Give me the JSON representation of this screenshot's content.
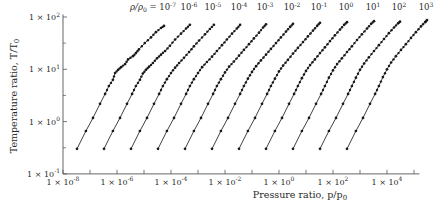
{
  "chart_data": {
    "type": "line",
    "title": "",
    "xlabel": "Pressure ratio, p/p0",
    "ylabel": "Temperature ratio, T/T0",
    "xscale": "log",
    "yscale": "log",
    "xlim": [
      1e-08,
      100000.0
    ],
    "ylim": [
      0.1,
      100
    ],
    "grid": false,
    "legend_position": "inline-top",
    "series_label_prefix": "ρ/ρ0 = ",
    "x_ticks": [
      "1 × 10^-8",
      "1 × 10^-6",
      "1 × 10^-4",
      "1 × 10^-2",
      "1 × 10^0",
      "1 × 10^2",
      "1 × 10^4"
    ],
    "y_ticks": [
      "1 × 10^-1",
      "1 × 10^0",
      "1 × 10^1",
      "1 × 10^2"
    ],
    "series": [
      {
        "name": "10^-7",
        "log_points": [
          [
            -7.48,
            -0.52
          ],
          [
            -7.15,
            -0.18
          ],
          [
            -6.89,
            0.07
          ],
          [
            -6.63,
            0.34
          ],
          [
            -6.44,
            0.53
          ],
          [
            -6.3,
            0.68
          ],
          [
            -6.15,
            0.8
          ],
          [
            -6.07,
            0.93
          ],
          [
            -5.96,
            0.99
          ],
          [
            -5.85,
            1.04
          ],
          [
            -5.7,
            1.1
          ],
          [
            -5.59,
            1.19
          ],
          [
            -5.41,
            1.25
          ],
          [
            -5.3,
            1.31
          ],
          [
            -5.19,
            1.38
          ],
          [
            -4.97,
            1.5
          ],
          [
            -4.74,
            1.61
          ],
          [
            -4.56,
            1.71
          ],
          [
            -4.37,
            1.79
          ],
          [
            -4.26,
            1.83
          ]
        ]
      },
      {
        "name": "10^-6",
        "log_points": [
          [
            -6.48,
            -0.52
          ],
          [
            -6.15,
            -0.18
          ],
          [
            -5.89,
            0.07
          ],
          [
            -5.63,
            0.34
          ],
          [
            -5.44,
            0.53
          ],
          [
            -5.3,
            0.68
          ],
          [
            -5.15,
            0.8
          ],
          [
            -5.04,
            0.92
          ],
          [
            -4.93,
            0.99
          ],
          [
            -4.81,
            1.05
          ],
          [
            -4.67,
            1.12
          ],
          [
            -4.52,
            1.21
          ],
          [
            -4.37,
            1.28
          ],
          [
            -4.22,
            1.35
          ],
          [
            -4.04,
            1.45
          ],
          [
            -3.85,
            1.57
          ],
          [
            -3.63,
            1.68
          ],
          [
            -3.44,
            1.78
          ],
          [
            -3.3,
            1.85
          ]
        ]
      },
      {
        "name": "10^-5",
        "log_points": [
          [
            -5.48,
            -0.52
          ],
          [
            -5.15,
            -0.18
          ],
          [
            -4.89,
            0.07
          ],
          [
            -4.63,
            0.34
          ],
          [
            -4.44,
            0.53
          ],
          [
            -4.3,
            0.68
          ],
          [
            -4.15,
            0.81
          ],
          [
            -4.0,
            0.93
          ],
          [
            -3.85,
            1.03
          ],
          [
            -3.7,
            1.12
          ],
          [
            -3.52,
            1.22
          ],
          [
            -3.33,
            1.33
          ],
          [
            -3.15,
            1.44
          ],
          [
            -2.96,
            1.55
          ],
          [
            -2.74,
            1.67
          ],
          [
            -2.56,
            1.77
          ],
          [
            -2.41,
            1.85
          ]
        ]
      },
      {
        "name": "10^-4",
        "log_points": [
          [
            -4.48,
            -0.52
          ],
          [
            -4.15,
            -0.18
          ],
          [
            -3.89,
            0.07
          ],
          [
            -3.63,
            0.34
          ],
          [
            -3.44,
            0.53
          ],
          [
            -3.3,
            0.68
          ],
          [
            -3.15,
            0.81
          ],
          [
            -3.0,
            0.93
          ],
          [
            -2.85,
            1.04
          ],
          [
            -2.67,
            1.14
          ],
          [
            -2.48,
            1.24
          ],
          [
            -2.3,
            1.35
          ],
          [
            -2.11,
            1.46
          ],
          [
            -1.93,
            1.57
          ],
          [
            -1.74,
            1.68
          ],
          [
            -1.56,
            1.78
          ],
          [
            -1.44,
            1.85
          ]
        ]
      },
      {
        "name": "10^-3",
        "log_points": [
          [
            -3.48,
            -0.52
          ],
          [
            -3.15,
            -0.18
          ],
          [
            -2.89,
            0.07
          ],
          [
            -2.63,
            0.34
          ],
          [
            -2.44,
            0.53
          ],
          [
            -2.3,
            0.68
          ],
          [
            -2.15,
            0.81
          ],
          [
            -2.0,
            0.94
          ],
          [
            -1.85,
            1.05
          ],
          [
            -1.67,
            1.15
          ],
          [
            -1.48,
            1.26
          ],
          [
            -1.3,
            1.37
          ],
          [
            -1.11,
            1.48
          ],
          [
            -0.93,
            1.59
          ],
          [
            -0.74,
            1.7
          ],
          [
            -0.59,
            1.8
          ],
          [
            -0.48,
            1.86
          ]
        ]
      },
      {
        "name": "10^-2",
        "log_points": [
          [
            -2.48,
            -0.52
          ],
          [
            -2.15,
            -0.18
          ],
          [
            -1.89,
            0.07
          ],
          [
            -1.63,
            0.34
          ],
          [
            -1.44,
            0.53
          ],
          [
            -1.3,
            0.68
          ],
          [
            -1.15,
            0.82
          ],
          [
            -1.0,
            0.95
          ],
          [
            -0.85,
            1.06
          ],
          [
            -0.67,
            1.17
          ],
          [
            -0.48,
            1.28
          ],
          [
            -0.3,
            1.39
          ],
          [
            -0.11,
            1.5
          ],
          [
            0.07,
            1.61
          ],
          [
            0.26,
            1.72
          ],
          [
            0.41,
            1.81
          ],
          [
            0.52,
            1.87
          ]
        ]
      },
      {
        "name": "10^-1",
        "log_points": [
          [
            -1.48,
            -0.52
          ],
          [
            -1.15,
            -0.18
          ],
          [
            -0.89,
            0.07
          ],
          [
            -0.63,
            0.34
          ],
          [
            -0.44,
            0.53
          ],
          [
            -0.3,
            0.68
          ],
          [
            -0.15,
            0.82
          ],
          [
            0.0,
            0.96
          ],
          [
            0.15,
            1.07
          ],
          [
            0.33,
            1.18
          ],
          [
            0.52,
            1.3
          ],
          [
            0.7,
            1.41
          ],
          [
            0.89,
            1.52
          ],
          [
            1.07,
            1.63
          ],
          [
            1.26,
            1.74
          ],
          [
            1.41,
            1.83
          ],
          [
            1.52,
            1.89
          ]
        ]
      },
      {
        "name": "10^0",
        "log_points": [
          [
            -0.48,
            -0.52
          ],
          [
            -0.15,
            -0.18
          ],
          [
            0.11,
            0.07
          ],
          [
            0.37,
            0.34
          ],
          [
            0.56,
            0.53
          ],
          [
            0.7,
            0.68
          ],
          [
            0.85,
            0.83
          ],
          [
            1.0,
            0.97
          ],
          [
            1.15,
            1.08
          ],
          [
            1.33,
            1.19
          ],
          [
            1.52,
            1.31
          ],
          [
            1.7,
            1.42
          ],
          [
            1.89,
            1.54
          ],
          [
            2.07,
            1.65
          ],
          [
            2.26,
            1.76
          ],
          [
            2.41,
            1.85
          ],
          [
            2.52,
            1.9
          ]
        ]
      },
      {
        "name": "10^1",
        "log_points": [
          [
            0.52,
            -0.52
          ],
          [
            0.85,
            -0.18
          ],
          [
            1.11,
            0.07
          ],
          [
            1.37,
            0.34
          ],
          [
            1.56,
            0.53
          ],
          [
            1.7,
            0.68
          ],
          [
            1.85,
            0.84
          ],
          [
            2.0,
            0.98
          ],
          [
            2.15,
            1.1
          ],
          [
            2.33,
            1.21
          ],
          [
            2.52,
            1.33
          ],
          [
            2.7,
            1.44
          ],
          [
            2.89,
            1.56
          ],
          [
            3.07,
            1.67
          ],
          [
            3.26,
            1.78
          ],
          [
            3.41,
            1.87
          ],
          [
            3.52,
            1.92
          ]
        ]
      },
      {
        "name": "10^2",
        "log_points": [
          [
            1.52,
            -0.52
          ],
          [
            1.85,
            -0.18
          ],
          [
            2.11,
            0.07
          ],
          [
            2.37,
            0.34
          ],
          [
            2.56,
            0.53
          ],
          [
            2.7,
            0.68
          ],
          [
            2.85,
            0.84
          ],
          [
            3.0,
            0.99
          ],
          [
            3.15,
            1.11
          ],
          [
            3.33,
            1.23
          ],
          [
            3.52,
            1.35
          ],
          [
            3.7,
            1.46
          ],
          [
            3.89,
            1.58
          ],
          [
            4.07,
            1.69
          ],
          [
            4.26,
            1.8
          ],
          [
            4.41,
            1.88
          ],
          [
            4.48,
            1.91
          ]
        ]
      },
      {
        "name": "10^3",
        "log_points": [
          [
            2.52,
            -0.52
          ],
          [
            2.85,
            -0.18
          ],
          [
            3.11,
            0.07
          ],
          [
            3.37,
            0.34
          ],
          [
            3.56,
            0.53
          ],
          [
            3.7,
            0.68
          ],
          [
            3.85,
            0.85
          ],
          [
            4.0,
            1.0
          ],
          [
            4.15,
            1.13
          ],
          [
            4.33,
            1.25
          ],
          [
            4.52,
            1.37
          ],
          [
            4.7,
            1.48
          ],
          [
            4.89,
            1.6
          ],
          [
            5.07,
            1.71
          ],
          [
            5.26,
            1.82
          ],
          [
            5.41,
            1.9
          ],
          [
            5.48,
            1.94
          ]
        ]
      }
    ]
  },
  "labels": {
    "ylabel": "Temperature ratio, T/T",
    "ylabel_sub": "0",
    "xlabel": "Pressure ratio, p/p",
    "xlabel_sub": "0",
    "series_prefix": "ρ/ρ",
    "series_prefix_sub": "0",
    "series_eq": " = "
  },
  "style": {
    "line_color": "#2a2a2a",
    "axis_color": "#555555",
    "marker_color": "#1a1a1a"
  }
}
